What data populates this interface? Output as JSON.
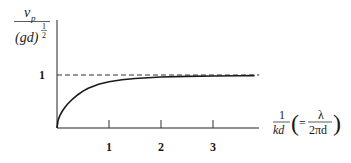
{
  "chart_data": {
    "type": "line",
    "title": "",
    "ylabel": {
      "numerator": "v",
      "numerator_sub": "p",
      "denominator": "(gd)",
      "denominator_exp_num": "1",
      "denominator_exp_den": "2"
    },
    "xlabel": {
      "frac_num": "1",
      "frac_den": "kd",
      "paren_open": "(",
      "equals": "=",
      "inner_num": "λ",
      "inner_den": "2πd",
      "paren_close": ")"
    },
    "xlim": [
      0,
      3.85
    ],
    "ylim": [
      0,
      2.0
    ],
    "x_ticks": [
      {
        "value": 1,
        "label": "1"
      },
      {
        "value": 2,
        "label": "2"
      },
      {
        "value": 3,
        "label": "3"
      }
    ],
    "y_ticks": [
      {
        "value": 1,
        "label": "1"
      }
    ],
    "asymptote": {
      "y": 1,
      "style": "dashed"
    },
    "series": [
      {
        "name": "vp / sqrt(gd) = sqrt(tanh(kd) / kd), plotted against 1/kd",
        "x": [
          0.0,
          0.02,
          0.05,
          0.1,
          0.15,
          0.2,
          0.3,
          0.4,
          0.5,
          0.6,
          0.8,
          1.0,
          1.25,
          1.5,
          2.0,
          2.5,
          3.0,
          3.5,
          3.8
        ],
        "y": [
          0.0,
          0.141,
          0.224,
          0.316,
          0.387,
          0.447,
          0.547,
          0.628,
          0.695,
          0.75,
          0.824,
          0.872,
          0.911,
          0.935,
          0.962,
          0.975,
          0.982,
          0.987,
          0.989
        ]
      }
    ],
    "grid": false,
    "legend": "none"
  }
}
